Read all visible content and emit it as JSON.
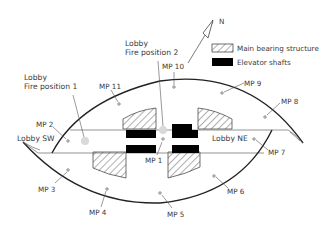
{
  "diagram": {
    "type": "floor-plan-measurement-points",
    "north_label": "N",
    "legend": [
      {
        "key": "hatched",
        "label": "Main bearing structure"
      },
      {
        "key": "solid-black",
        "label": "Elevator shafts"
      }
    ],
    "fire_positions": [
      {
        "label_line1": "Lobby",
        "label_line2": "Fire position 1"
      },
      {
        "label_line1": "Lobby",
        "label_line2": "Fire position 2"
      }
    ],
    "lobbies": [
      {
        "label": "Lobby SW"
      },
      {
        "label": "Lobby NE"
      }
    ],
    "measurement_points": [
      {
        "label": "MP 1"
      },
      {
        "label": "MP 2"
      },
      {
        "label": "MP 3"
      },
      {
        "label": "MP 4"
      },
      {
        "label": "MP 5"
      },
      {
        "label": "MP 6"
      },
      {
        "label": "MP 7"
      },
      {
        "label": "MP 8"
      },
      {
        "label": "MP 9"
      },
      {
        "label": "MP 10"
      },
      {
        "label": "MP 11"
      }
    ],
    "colors": {
      "outline": "#222222",
      "fire_position_marker": "#d9d9d9",
      "shaft": "#000000",
      "text": "#3a3a3a"
    }
  }
}
